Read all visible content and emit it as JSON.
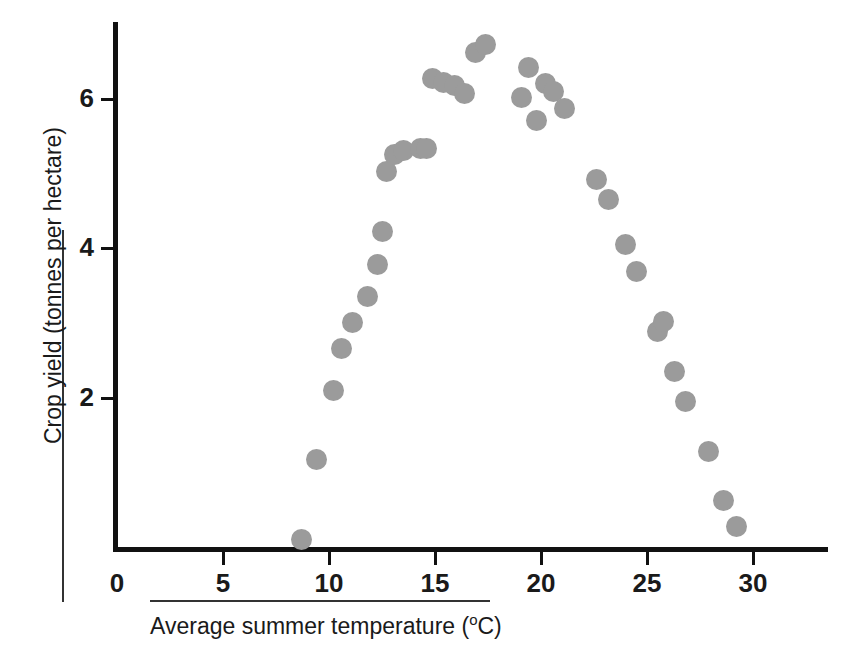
{
  "chart_data": {
    "type": "scatter",
    "title": "",
    "subtitle": "",
    "xlabel": "Average summer temperature (°C)",
    "xlabel_main": "Average summer temperature (",
    "xlabel_unit_sup": "o",
    "xlabel_unit_rest": "C)",
    "ylabel": "Crop yield (tonnes per hectare)",
    "xlim": [
      0,
      33.7
    ],
    "ylim": [
      0,
      7.05
    ],
    "xticks": [
      0,
      5,
      10,
      15,
      20,
      25,
      30
    ],
    "xticklabels": [
      "0",
      "5",
      "10",
      "15",
      "20",
      "25",
      "30"
    ],
    "yticks": [
      2,
      4,
      6
    ],
    "yticklabels": [
      "2",
      "4",
      "6"
    ],
    "grid": false,
    "legend": false,
    "marker": {
      "shape": "circle",
      "color": "#9b9b9b",
      "size_px": 21
    },
    "series": [
      {
        "name": "Crop yield",
        "points": [
          [
            8.7,
            0.1
          ],
          [
            9.4,
            1.17
          ],
          [
            10.2,
            2.1
          ],
          [
            10.6,
            2.66
          ],
          [
            11.1,
            3.0
          ],
          [
            11.8,
            3.35
          ],
          [
            12.5,
            4.22
          ],
          [
            12.3,
            3.78
          ],
          [
            12.7,
            5.02
          ],
          [
            13.1,
            5.25
          ],
          [
            13.5,
            5.3
          ],
          [
            14.3,
            5.33
          ],
          [
            14.6,
            5.33
          ],
          [
            14.9,
            6.27
          ],
          [
            15.4,
            6.22
          ],
          [
            15.9,
            6.17
          ],
          [
            16.4,
            6.07
          ],
          [
            16.9,
            6.62
          ],
          [
            17.4,
            6.72
          ],
          [
            19.1,
            6.02
          ],
          [
            19.4,
            6.42
          ],
          [
            19.8,
            5.7
          ],
          [
            20.2,
            6.2
          ],
          [
            20.6,
            6.1
          ],
          [
            21.1,
            5.87
          ],
          [
            22.6,
            4.92
          ],
          [
            23.2,
            4.65
          ],
          [
            24.0,
            4.05
          ],
          [
            24.5,
            3.68
          ],
          [
            25.5,
            2.88
          ],
          [
            25.8,
            3.02
          ],
          [
            26.3,
            2.35
          ],
          [
            26.8,
            1.95
          ],
          [
            27.9,
            1.28
          ],
          [
            28.6,
            0.62
          ],
          [
            29.2,
            0.28
          ]
        ]
      }
    ]
  },
  "axis": {
    "x_origin_px": 117,
    "y_zero_px": 547,
    "px_per_x_unit": 21.2,
    "px_per_y_unit": 74.75
  },
  "colors": {
    "marker": "#9b9b9b",
    "axis": "#111111",
    "text": "#1a1a1a",
    "rule": "#333333",
    "background": "#ffffff"
  }
}
